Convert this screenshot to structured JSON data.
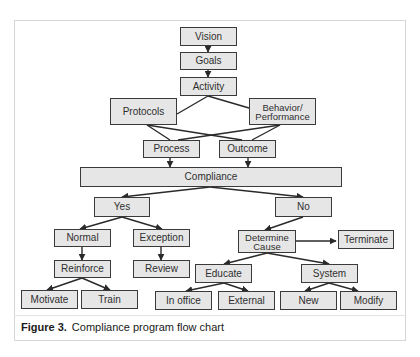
{
  "figure": {
    "caption_label": "Figure 3.",
    "caption_text": "Compliance program flow chart"
  },
  "colors": {
    "node_fill": "#e6e6e6",
    "node_border": "#3a3a3a",
    "line": "#2a2a2a",
    "frame_border": "#d6d6d6"
  },
  "nodes": {
    "vision": "Vision",
    "goals": "Goals",
    "activity": "Activity",
    "protocols": "Protocols",
    "behavior": "Behavior/\nPerformance",
    "process": "Process",
    "outcome": "Outcome",
    "compliance": "Compliance",
    "yes": "Yes",
    "no": "No",
    "normal": "Normal",
    "exception": "Exception",
    "determine_cause": "Determine\nCause",
    "terminate": "Terminate",
    "reinforce": "Reinforce",
    "review": "Review",
    "educate": "Educate",
    "system": "System",
    "motivate": "Motivate",
    "train": "Train",
    "in_office": "In office",
    "external": "External",
    "new": "New",
    "modify": "Modify"
  },
  "edges": [
    [
      "Vision",
      "Goals"
    ],
    [
      "Goals",
      "Activity"
    ],
    [
      "Activity",
      "Protocols"
    ],
    [
      "Activity",
      "Behavior/Performance"
    ],
    [
      "Protocols",
      "Process"
    ],
    [
      "Protocols",
      "Outcome"
    ],
    [
      "Behavior/Performance",
      "Process"
    ],
    [
      "Behavior/Performance",
      "Outcome"
    ],
    [
      "Process",
      "Compliance"
    ],
    [
      "Outcome",
      "Compliance"
    ],
    [
      "Compliance",
      "Yes"
    ],
    [
      "Compliance",
      "No"
    ],
    [
      "Yes",
      "Normal"
    ],
    [
      "Yes",
      "Exception"
    ],
    [
      "Normal",
      "Reinforce"
    ],
    [
      "Exception",
      "Review"
    ],
    [
      "Reinforce",
      "Motivate"
    ],
    [
      "Reinforce",
      "Train"
    ],
    [
      "No",
      "Determine Cause"
    ],
    [
      "Determine Cause",
      "Terminate"
    ],
    [
      "Determine Cause",
      "Educate"
    ],
    [
      "Determine Cause",
      "System"
    ],
    [
      "Educate",
      "In office"
    ],
    [
      "Educate",
      "External"
    ],
    [
      "System",
      "New"
    ],
    [
      "System",
      "Modify"
    ]
  ]
}
